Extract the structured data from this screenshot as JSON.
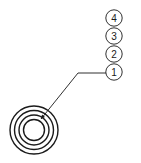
{
  "diagram": {
    "title": "",
    "balloons": [
      {
        "label": "4"
      },
      {
        "label": "3"
      },
      {
        "label": "2"
      },
      {
        "label": "1"
      }
    ],
    "leader_target": "concentric-rings",
    "ring_count": 4,
    "line_color": "#1a1a1a",
    "background": "#ffffff"
  }
}
